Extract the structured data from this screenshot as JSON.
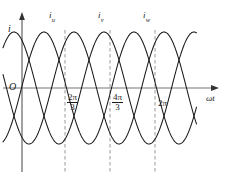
{
  "figure": {
    "kind": "three-phase-current-waveform-diagram",
    "background_color": "#ffffff",
    "curve_color": "#1a1a1a",
    "axis_color": "#555555",
    "dashed_color": "#8c8c8c"
  },
  "axes": {
    "y_label": "i",
    "x_label": "ωt",
    "origin_label": "O"
  },
  "curve_labels": [
    {
      "base": "i",
      "sub": "u"
    },
    {
      "base": "i",
      "sub": "v"
    },
    {
      "base": "i",
      "sub": "w"
    }
  ],
  "tick_labels": [
    {
      "numerator": "2π",
      "denominator": "3",
      "is_fraction": true
    },
    {
      "numerator": "4π",
      "denominator": "3",
      "is_fraction": true
    },
    {
      "text": "2π",
      "is_fraction": false
    }
  ],
  "chart_data": {
    "type": "line",
    "title": "",
    "xlabel": "ωt",
    "ylabel": "i",
    "grid": false,
    "legend": "inline-above-peaks",
    "x_unit": "radians",
    "x_range_rad": [
      -0.7,
      13.3
    ],
    "ylim": [
      -1,
      1
    ],
    "period_rad": 6.2832,
    "amplitude": 1,
    "x_ticks_rad": [
      2.0944,
      4.18879,
      6.28319
    ],
    "x_tick_labels": [
      "2π/3",
      "4π/3",
      "2π"
    ],
    "series": [
      {
        "name": "i_u",
        "phase_deg": 0,
        "formula": "sin(wt)"
      },
      {
        "name": "i_v",
        "phase_deg": -120,
        "formula": "sin(wt - 2pi/3)"
      },
      {
        "name": "i_w",
        "phase_deg": -240,
        "formula": "sin(wt - 4pi/3)"
      }
    ]
  },
  "geometry": {
    "y_axis_x": 22,
    "zero_line_y": 88,
    "amplitude_px": 56,
    "period_px": 90,
    "x_start": 3,
    "x_end": 197,
    "axis_arrow_x": 218,
    "y_axis_top": 14,
    "y_axis_bottom": 172,
    "dash_x": [
      65,
      110,
      155
    ],
    "dash_top": 30,
    "dash_bottom": 172,
    "u_peak_x": 44
  }
}
